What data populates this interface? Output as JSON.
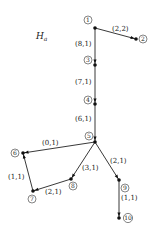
{
  "graph": {
    "title": "H",
    "title_subscript": "a",
    "nodes": [
      {
        "id": "1",
        "label": "1",
        "x": 95,
        "y": 28,
        "lx": 88,
        "ly": 20
      },
      {
        "id": "2",
        "label": "2",
        "x": 136,
        "y": 39,
        "lx": 143,
        "ly": 39
      },
      {
        "id": "3",
        "label": "3",
        "x": 95,
        "y": 65,
        "lx": 88,
        "ly": 60
      },
      {
        "id": "4",
        "label": "4",
        "x": 95,
        "y": 104,
        "lx": 88,
        "ly": 100
      },
      {
        "id": "5",
        "label": "5",
        "x": 95,
        "y": 142,
        "lx": 89,
        "ly": 136
      },
      {
        "id": "6",
        "label": "6",
        "x": 23,
        "y": 153,
        "lx": 15,
        "ly": 153
      },
      {
        "id": "7",
        "label": "7",
        "x": 33,
        "y": 191,
        "lx": 32,
        "ly": 199
      },
      {
        "id": "8",
        "label": "8",
        "x": 71,
        "y": 179,
        "lx": 73,
        "ly": 186
      },
      {
        "id": "9",
        "label": "9",
        "x": 119,
        "y": 180,
        "lx": 125,
        "ly": 188
      },
      {
        "id": "10",
        "label": "10",
        "x": 119,
        "y": 218,
        "lx": 128,
        "ly": 218
      }
    ],
    "edges": [
      {
        "from": "1",
        "to": "2",
        "label": "(2,2)",
        "lx": 112,
        "ly": 31
      },
      {
        "from": "1",
        "to": "3",
        "label": "(8,1)",
        "lx": 75,
        "ly": 46
      },
      {
        "from": "3",
        "to": "4",
        "label": "(7,1)",
        "lx": 75,
        "ly": 84
      },
      {
        "from": "4",
        "to": "5",
        "label": "(6,1)",
        "lx": 75,
        "ly": 121
      },
      {
        "from": "5",
        "to": "6",
        "label": "(0,1)",
        "lx": 42,
        "ly": 145
      },
      {
        "from": "7",
        "to": "6",
        "label": "(1,1)",
        "lx": 8,
        "ly": 179
      },
      {
        "from": "8",
        "to": "7",
        "label": "(2,1)",
        "lx": 45,
        "ly": 194
      },
      {
        "from": "5",
        "to": "8",
        "label": "(3,1)",
        "lx": 82,
        "ly": 170
      },
      {
        "from": "5",
        "to": "9",
        "label": "(2,1)",
        "lx": 110,
        "ly": 163
      },
      {
        "from": "9",
        "to": "10",
        "label": "(1,1)",
        "lx": 121,
        "ly": 200
      }
    ]
  }
}
